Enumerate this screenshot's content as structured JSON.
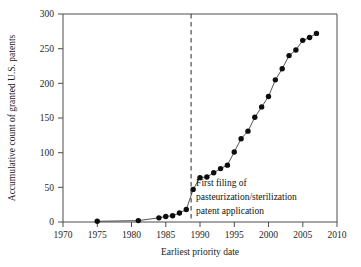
{
  "chart_data": {
    "type": "line",
    "title": "",
    "xlabel": "Earliest priority date",
    "ylabel": "Accumulative count of granted U.S. patents",
    "xlim": [
      1970,
      2010
    ],
    "ylim": [
      0,
      300
    ],
    "grid": false,
    "legend": null,
    "xticks": [
      1970,
      1975,
      1980,
      1985,
      1990,
      1995,
      2000,
      2005,
      2010
    ],
    "yticks": [
      0,
      50,
      100,
      150,
      200,
      250,
      300
    ],
    "marker": "filled-circle",
    "series": [
      {
        "name": "Accumulative granted U.S. patents",
        "x": [
          1975,
          1981,
          1984,
          1985,
          1986,
          1987,
          1988,
          1989,
          1990,
          1991,
          1992,
          1993,
          1994,
          1995,
          1996,
          1997,
          1998,
          1999,
          2000,
          2001,
          2002,
          2003,
          2004,
          2005,
          2006,
          2007
        ],
        "values": [
          1,
          2,
          6,
          8,
          9,
          13,
          18,
          47,
          64,
          65,
          71,
          77,
          82,
          101,
          120,
          131,
          151,
          166,
          181,
          205,
          221,
          240,
          248,
          262,
          266,
          272
        ]
      }
    ],
    "annotations": [
      {
        "type": "vline",
        "x": 1988.7,
        "style": "dashed",
        "label_lines": [
          "First filing of",
          "pasteurization/sterilization",
          "patent application"
        ]
      }
    ]
  },
  "labels": {
    "y_axis_title": "Accumulative count of granted U.S. patents",
    "x_axis_title": "Earliest priority date",
    "annotation_line_1": "First filing of",
    "annotation_line_2": "pasteurization/sterilization",
    "annotation_line_3": "patent application",
    "ytick_0": "0",
    "ytick_1": "50",
    "ytick_2": "100",
    "ytick_3": "150",
    "ytick_4": "200",
    "ytick_5": "250",
    "ytick_6": "300",
    "xtick_0": "1970",
    "xtick_1": "1975",
    "xtick_2": "1980",
    "xtick_3": "1985",
    "xtick_4": "1990",
    "xtick_5": "1995",
    "xtick_6": "2000",
    "xtick_7": "2005",
    "xtick_8": "2010"
  },
  "colors": {
    "line": "#404040",
    "marker": "#0d0d0d",
    "axis": "#4d4d4d",
    "text": "#1a1a1a",
    "background": "#ffffff"
  }
}
